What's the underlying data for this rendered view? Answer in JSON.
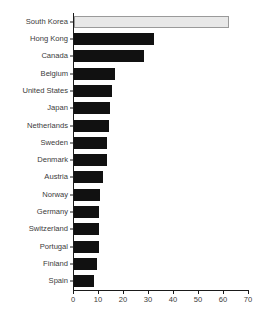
{
  "chart_data": {
    "type": "bar",
    "orientation": "horizontal",
    "title": "",
    "xlabel": "",
    "ylabel": "",
    "xlim": [
      0,
      70
    ],
    "xticks": [
      0,
      10,
      20,
      30,
      40,
      50,
      60,
      70
    ],
    "xtick_labels": [
      "0",
      "10",
      "20",
      "30",
      "40",
      "50",
      "60",
      "70"
    ],
    "grid": false,
    "legend": "none",
    "categories": [
      "South Korea",
      "Hong Kong",
      "Canada",
      "Belgium",
      "United States",
      "Japan",
      "Netherlands",
      "Sweden",
      "Denmark",
      "Austria",
      "Norway",
      "Germany",
      "Switzerland",
      "Portugal",
      "Finland",
      "Spain"
    ],
    "values": [
      62,
      32,
      28,
      16.5,
      15,
      14.5,
      14,
      13,
      13,
      11.5,
      10.5,
      10,
      10,
      10,
      9,
      8
    ],
    "highlight_index": 0,
    "colors": {
      "bar": "#111111",
      "highlight_fill": "#e8e8e8",
      "highlight_border": "#9a9a9a",
      "axis": "#1a1a1a",
      "text": "#3b3b3b",
      "background": "#ffffff"
    }
  }
}
